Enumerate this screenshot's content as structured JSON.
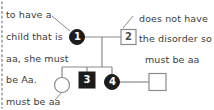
{
  "diagram": {
    "type": "pedigree-chart",
    "title": "",
    "colors": {
      "affected_fill": "#1c1c1c",
      "unaffected_fill": "#ffffff",
      "stroke": "#8a8a8a",
      "text": "#3b3b3b",
      "label_on_dark": "#ffffff",
      "label_on_light": "#4a4a4a",
      "background": "#ffffff"
    },
    "annotations": [
      {
        "id": "note-left",
        "lines": [
          "to have a",
          "child that is",
          "aa, she must",
          "be Aa."
        ],
        "points_to": "individual-1"
      },
      {
        "id": "note-right",
        "lines": [
          "does not have",
          "the disorder so",
          "must be aa"
        ],
        "points_to": "individual-2"
      },
      {
        "id": "note-bottom",
        "lines": [
          "must be aa"
        ],
        "points_to": "individual-unaffected-female"
      }
    ],
    "individuals": [
      {
        "id": "individual-1",
        "label": "1",
        "shape": "circle",
        "sex": "female",
        "status": "affected"
      },
      {
        "id": "individual-2",
        "label": "2",
        "shape": "square",
        "sex": "male",
        "status": "unaffected"
      },
      {
        "id": "individual-daughter",
        "label": "",
        "shape": "circle",
        "sex": "female",
        "status": "unaffected"
      },
      {
        "id": "individual-3",
        "label": "3",
        "shape": "square",
        "sex": "male",
        "status": "affected"
      },
      {
        "id": "individual-4",
        "label": "4",
        "shape": "circle",
        "sex": "female",
        "status": "affected"
      },
      {
        "id": "individual-spouse",
        "label": "",
        "shape": "square",
        "sex": "male",
        "status": "unaffected"
      }
    ]
  }
}
